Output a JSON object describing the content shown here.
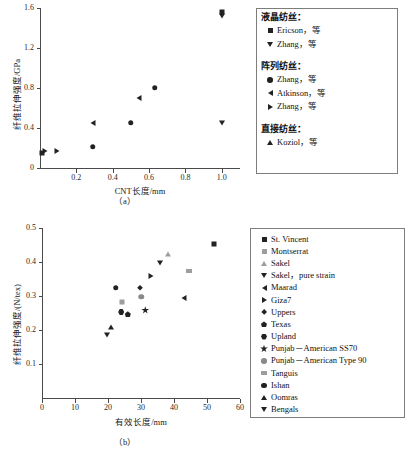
{
  "figure": {
    "panel_a_caption": "（a）",
    "panel_b_caption": "（b）"
  },
  "chart_data": [
    {
      "type": "scatter",
      "panel": "a",
      "title": "",
      "xlabel": "CNT长度/mm",
      "ylabel": "纤维拉伸强度/GPa",
      "xlim": [
        0,
        1.1
      ],
      "ylim": [
        0,
        1.6
      ],
      "xticks": [
        "0.2",
        "0.4",
        "0.6",
        "0.8",
        "1.0"
      ],
      "xtickvals": [
        0.2,
        0.4,
        0.6,
        0.8,
        1.0
      ],
      "yticks": [
        "0",
        "0.4",
        "0.8",
        "1.2",
        "1.6"
      ],
      "ytickvals": [
        0,
        0.4,
        0.8,
        1.2,
        1.6
      ],
      "grid": false,
      "legend_position": "right-outside",
      "series": [
        {
          "name": "Ericson，等",
          "group": "液晶纺丝：",
          "marker": "square",
          "points": [
            [
              0.01,
              0.155
            ],
            [
              1.0,
              1.565
            ]
          ]
        },
        {
          "name": "Zhang，等",
          "group": "液晶纺丝：",
          "marker": "tri-down",
          "points": [
            [
              1.0,
              1.525
            ],
            [
              1.0,
              0.45
            ]
          ]
        },
        {
          "name": "Zhang，等",
          "group": "阵列纺丝：",
          "marker": "circle",
          "points": [
            [
              0.29,
              0.215
            ],
            [
              0.5,
              0.455
            ],
            [
              0.63,
              0.805
            ]
          ]
        },
        {
          "name": "Atkinson，等",
          "group": "阵列纺丝：",
          "marker": "tri-left",
          "points": [
            [
              0.29,
              0.45
            ],
            [
              0.545,
              0.7
            ]
          ]
        },
        {
          "name": "Zhang，等",
          "group": "阵列纺丝：",
          "marker": "tri-right",
          "points": [
            [
              0.025,
              0.17
            ],
            [
              0.095,
              0.17
            ]
          ]
        },
        {
          "name": "Koziol，等",
          "group": "直接纺丝：",
          "marker": "tri-up",
          "points": []
        }
      ]
    },
    {
      "type": "scatter",
      "panel": "b",
      "title": "",
      "xlabel": "有效长度/mm",
      "ylabel": "纤维拉伸强度/(N/tex)",
      "xlim": [
        0,
        60
      ],
      "ylim": [
        0,
        0.5
      ],
      "xticks": [
        "0",
        "10",
        "20",
        "30",
        "40",
        "50",
        "60"
      ],
      "xtickvals": [
        0,
        10,
        20,
        30,
        40,
        50,
        60
      ],
      "yticks": [
        "0.1",
        "0.2",
        "0.3",
        "0.4",
        "0.5"
      ],
      "ytickvals": [
        0.1,
        0.2,
        0.3,
        0.4,
        0.5
      ],
      "grid": false,
      "legend_position": "right-outside",
      "series": [
        {
          "name": "St. Vincent",
          "marker": "square",
          "color": "#222222",
          "points": [
            [
              52.0,
              0.452
            ]
          ]
        },
        {
          "name": "Montserrat",
          "marker": "square",
          "color": "#9d9d9d",
          "points": [
            [
              24.3,
              0.281
            ]
          ]
        },
        {
          "name": "Sakel",
          "marker": "tri-up",
          "color": "#9d9d9d",
          "points": [
            [
              38.2,
              0.424
            ]
          ]
        },
        {
          "name": "Sakel，pure strain",
          "marker": "tri-down",
          "color": "#222222",
          "points": [
            [
              35.8,
              0.398
            ]
          ]
        },
        {
          "name": "Maarad",
          "marker": "tri-left",
          "color": "#222222",
          "points": [
            [
              43.0,
              0.294
            ]
          ]
        },
        {
          "name": "Giza7",
          "marker": "tri-right",
          "color": "#222222",
          "points": [
            [
              33.0,
              0.36
            ]
          ]
        },
        {
          "name": "Uppers",
          "marker": "diamond",
          "color": "#222222",
          "points": [
            [
              29.8,
              0.323
            ]
          ]
        },
        {
          "name": "Texas",
          "marker": "pentagon",
          "color": "#222222",
          "points": [
            [
              26.0,
              0.246
            ]
          ]
        },
        {
          "name": "Upland",
          "marker": "hexagon",
          "color": "#222222",
          "points": [
            [
              24.0,
              0.253
            ]
          ]
        },
        {
          "name": "Punjab－American SS70",
          "marker": "star",
          "color": "#222222",
          "points": [
            [
              31.3,
              0.258
            ]
          ]
        },
        {
          "name": "Punjab－American Type 90",
          "marker": "circle",
          "color": "#8a8a8a",
          "points": [
            [
              30.1,
              0.298
            ]
          ]
        },
        {
          "name": "Tanguis",
          "marker": "hline",
          "color": "#9d9d9d",
          "points": [
            [
              44.5,
              0.373
            ]
          ]
        },
        {
          "name": "Ishan",
          "marker": "circle",
          "color": "#222222",
          "points": [
            [
              22.3,
              0.325
            ]
          ]
        },
        {
          "name": "Oomras",
          "marker": "tri-up",
          "color": "#222222",
          "points": [
            [
              20.8,
              0.21
            ]
          ]
        },
        {
          "name": "Bengals",
          "marker": "tri-down",
          "color": "#222222",
          "points": [
            [
              19.8,
              0.186
            ]
          ]
        }
      ]
    }
  ],
  "legend_a": {
    "groups": [
      {
        "header": "液晶纺丝：",
        "items": [
          {
            "marker": "square",
            "label": "Ericson，等"
          },
          {
            "marker": "tri-down",
            "label": "Zhang，等"
          }
        ]
      },
      {
        "header": "阵列纺丝：",
        "items": [
          {
            "marker": "circle",
            "label": "Zhang，等"
          },
          {
            "marker": "tri-left",
            "label": "Atkinson，等"
          },
          {
            "marker": "tri-right",
            "label": "Zhang，等"
          }
        ]
      },
      {
        "header": "直接纺丝：",
        "items": [
          {
            "marker": "tri-up",
            "label": "Koziol，等"
          }
        ]
      }
    ]
  },
  "legend_b": {
    "items": [
      {
        "marker": "square",
        "color": "#222222",
        "label": "St. Vincent"
      },
      {
        "marker": "square",
        "color": "#9d9d9d",
        "label": "Montserrat"
      },
      {
        "marker": "tri-up",
        "color": "#9d9d9d",
        "label": "Sakel"
      },
      {
        "marker": "tri-down",
        "color": "#222222",
        "label": "Sakel，pure strain"
      },
      {
        "marker": "tri-left",
        "color": "#222222",
        "label": "Maarad"
      },
      {
        "marker": "tri-right",
        "color": "#222222",
        "label": "Giza7"
      },
      {
        "marker": "diamond",
        "color": "#222222",
        "label": "Uppers"
      },
      {
        "marker": "pentagon",
        "color": "#222222",
        "label": "Texas"
      },
      {
        "marker": "hexagon",
        "color": "#222222",
        "label": "Upland"
      },
      {
        "marker": "star",
        "color": "#222222",
        "label": "Punjab－American SS70"
      },
      {
        "marker": "circle",
        "color": "#8a8a8a",
        "label": "Punjab－American Type 90"
      },
      {
        "marker": "hline",
        "color": "#9d9d9d",
        "label": "Tanguis"
      },
      {
        "marker": "circle",
        "color": "#222222",
        "label": "Ishan"
      },
      {
        "marker": "tri-up",
        "color": "#222222",
        "label": "Oomras"
      },
      {
        "marker": "tri-down",
        "color": "#222222",
        "label": "Bengals"
      }
    ]
  }
}
